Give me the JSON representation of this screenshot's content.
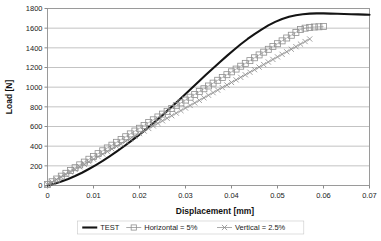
{
  "chart_data": {
    "type": "line",
    "title": "",
    "xlabel": "Displacement [mm]",
    "ylabel": "Load [N]",
    "xlim": [
      0,
      0.07
    ],
    "ylim": [
      0,
      1800
    ],
    "xticks": [
      "0",
      "0.01",
      "0.02",
      "0.03",
      "0.04",
      "0.05",
      "0.06",
      "0.07"
    ],
    "xtick_values": [
      0,
      0.01,
      0.02,
      0.03,
      0.04,
      0.05,
      0.06,
      0.07
    ],
    "yticks": [
      "0",
      "200",
      "400",
      "600",
      "800",
      "1000",
      "1200",
      "1400",
      "1600",
      "1800"
    ],
    "ytick_values": [
      0,
      200,
      400,
      600,
      800,
      1000,
      1200,
      1400,
      1600,
      1800
    ],
    "grid": "horizontal",
    "legend_position": "bottom",
    "series": [
      {
        "name": "TEST",
        "style": "solid-line",
        "marker": "none",
        "color": "#141414",
        "x": [
          0,
          0.0015,
          0.003,
          0.0045,
          0.006,
          0.0075,
          0.009,
          0.0105,
          0.012,
          0.0135,
          0.015,
          0.0165,
          0.018,
          0.0195,
          0.021,
          0.0225,
          0.024,
          0.0255,
          0.027,
          0.0285,
          0.03,
          0.0315,
          0.033,
          0.0345,
          0.036,
          0.0375,
          0.039,
          0.0405,
          0.042,
          0.0435,
          0.045,
          0.0465,
          0.048,
          0.0495,
          0.051,
          0.0525,
          0.054,
          0.0555,
          0.057,
          0.0585,
          0.06,
          0.0615,
          0.063,
          0.0645,
          0.066,
          0.0675,
          0.069,
          0.07
        ],
        "y": [
          0,
          18,
          40,
          66,
          96,
          130,
          168,
          208,
          250,
          296,
          344,
          394,
          446,
          500,
          556,
          614,
          674,
          736,
          800,
          864,
          930,
          996,
          1062,
          1128,
          1192,
          1256,
          1318,
          1378,
          1436,
          1490,
          1540,
          1586,
          1628,
          1664,
          1694,
          1716,
          1732,
          1742,
          1748,
          1750,
          1750,
          1748,
          1746,
          1744,
          1742,
          1740,
          1738,
          1737
        ]
      },
      {
        "name": "Horizontal = 5%",
        "style": "markers-line",
        "marker": "open-square",
        "color": "#8f8f8f",
        "x": [
          0,
          0.001,
          0.002,
          0.003,
          0.004,
          0.005,
          0.006,
          0.007,
          0.008,
          0.009,
          0.01,
          0.011,
          0.012,
          0.013,
          0.014,
          0.015,
          0.016,
          0.017,
          0.018,
          0.019,
          0.02,
          0.021,
          0.022,
          0.023,
          0.024,
          0.025,
          0.026,
          0.027,
          0.028,
          0.029,
          0.03,
          0.031,
          0.032,
          0.033,
          0.034,
          0.035,
          0.036,
          0.037,
          0.038,
          0.039,
          0.04,
          0.041,
          0.042,
          0.043,
          0.044,
          0.045,
          0.046,
          0.047,
          0.048,
          0.049,
          0.05,
          0.051,
          0.052,
          0.053,
          0.054,
          0.055,
          0.056,
          0.057,
          0.058,
          0.059,
          0.06
        ],
        "y": [
          10,
          38,
          66,
          95,
          124,
          152,
          181,
          210,
          238,
          267,
          296,
          324,
          353,
          382,
          410,
          439,
          468,
          496,
          525,
          554,
          582,
          611,
          640,
          668,
          697,
          726,
          754,
          783,
          812,
          840,
          869,
          898,
          926,
          955,
          984,
          1012,
          1041,
          1070,
          1098,
          1127,
          1156,
          1184,
          1213,
          1242,
          1270,
          1299,
          1328,
          1356,
          1385,
          1414,
          1442,
          1471,
          1500,
          1528,
          1557,
          1586,
          1600,
          1608,
          1612,
          1614,
          1616
        ]
      },
      {
        "name": "Vertical = 2.5%",
        "style": "markers-line",
        "marker": "x",
        "color": "#8f8f8f",
        "x": [
          0,
          0.001,
          0.002,
          0.003,
          0.004,
          0.005,
          0.006,
          0.007,
          0.008,
          0.009,
          0.01,
          0.011,
          0.012,
          0.013,
          0.014,
          0.015,
          0.016,
          0.017,
          0.018,
          0.019,
          0.02,
          0.021,
          0.022,
          0.023,
          0.024,
          0.025,
          0.026,
          0.027,
          0.028,
          0.029,
          0.03,
          0.031,
          0.032,
          0.033,
          0.034,
          0.035,
          0.036,
          0.037,
          0.038,
          0.039,
          0.04,
          0.041,
          0.042,
          0.043,
          0.044,
          0.045,
          0.046,
          0.047,
          0.048,
          0.049,
          0.05,
          0.051,
          0.052,
          0.053,
          0.054,
          0.055,
          0.056,
          0.057
        ],
        "y": [
          8,
          34,
          60,
          86,
          112,
          138,
          164,
          190,
          216,
          242,
          268,
          294,
          320,
          346,
          372,
          398,
          424,
          450,
          476,
          502,
          528,
          554,
          580,
          606,
          632,
          658,
          684,
          710,
          736,
          762,
          788,
          814,
          840,
          866,
          892,
          918,
          944,
          970,
          996,
          1022,
          1048,
          1074,
          1100,
          1126,
          1152,
          1178,
          1204,
          1230,
          1256,
          1282,
          1308,
          1334,
          1360,
          1386,
          1412,
          1438,
          1464,
          1490
        ]
      }
    ],
    "legend": [
      {
        "label": "TEST",
        "marker": "solid-line",
        "color": "#141414"
      },
      {
        "label": "Horizontal = 5%",
        "marker": "open-square",
        "color": "#8f8f8f"
      },
      {
        "label": "Vertical = 2.5%",
        "marker": "x",
        "color": "#8f8f8f"
      }
    ]
  }
}
